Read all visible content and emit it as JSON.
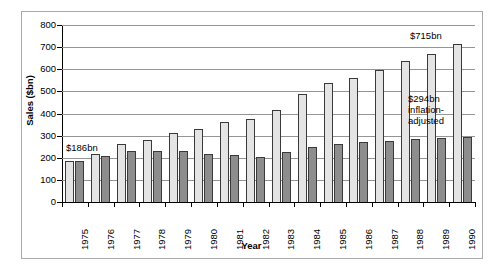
{
  "chart_data": {
    "type": "bar",
    "title": "",
    "xlabel": "Year",
    "ylabel": "Sales ($bn)",
    "ylim": [
      0,
      800
    ],
    "ytick_step": 100,
    "yticks": [
      0,
      100,
      200,
      300,
      400,
      500,
      600,
      700,
      800
    ],
    "ytick_labels": [
      "0",
      "100",
      "200",
      "300",
      "400",
      "500",
      "600",
      "700",
      "800"
    ],
    "grid": true,
    "legend_position": "none",
    "categories": [
      "1975",
      "1976",
      "1977",
      "1978",
      "1979",
      "1980",
      "1981",
      "1982",
      "1983",
      "1984",
      "1985",
      "1986",
      "1987",
      "1988",
      "1989",
      "1990"
    ],
    "series": [
      {
        "name": "Sales",
        "color": "#e4e4e4",
        "values": [
          186,
          218,
          261,
          281,
          311,
          331,
          362,
          375,
          417,
          489,
          538,
          560,
          598,
          637,
          667,
          715
        ]
      },
      {
        "name": "Inflation-adjusted sales",
        "color": "#8d8d8d",
        "values": [
          186,
          206,
          231,
          232,
          231,
          218,
          212,
          205,
          226,
          250,
          263,
          271,
          275,
          284,
          290,
          294
        ]
      }
    ],
    "annotations": [
      {
        "id": "first",
        "text": "$186bn",
        "category": "1975",
        "series": "Sales",
        "value": 186
      },
      {
        "id": "peak",
        "text": "$715bn",
        "category": "1990",
        "series": "Sales",
        "value": 715
      },
      {
        "id": "adjusted",
        "text": "$294bn inflation-adjusted",
        "category": "1990",
        "series": "Inflation-adjusted sales",
        "value": 294
      }
    ]
  }
}
